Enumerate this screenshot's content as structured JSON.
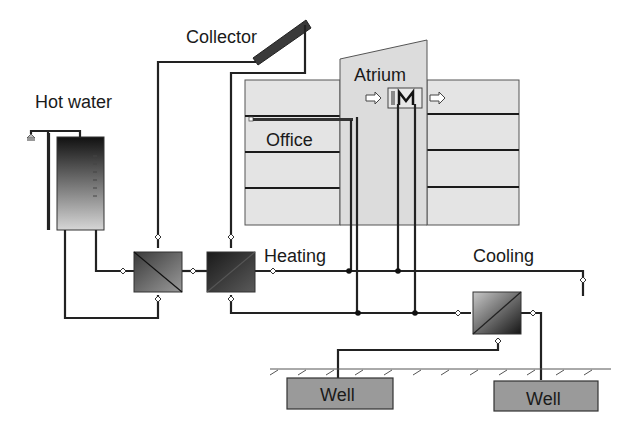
{
  "diagram": {
    "labels": {
      "collector": "Collector",
      "hot_water": "Hot water",
      "atrium": "Atrium",
      "office": "Office",
      "heating": "Heating",
      "cooling": "Cooling",
      "well_left": "Well",
      "well_right": "Well"
    },
    "components": [
      {
        "id": "collector",
        "type": "solar-collector"
      },
      {
        "id": "hot_water_tank",
        "type": "storage-tank"
      },
      {
        "id": "shower",
        "type": "tap"
      },
      {
        "id": "hx_hot_water",
        "type": "heat-exchanger"
      },
      {
        "id": "hx_heating",
        "type": "heat-exchanger"
      },
      {
        "id": "hx_cooling",
        "type": "heat-exchanger"
      },
      {
        "id": "office_building",
        "type": "building",
        "floors": 4
      },
      {
        "id": "atrium",
        "type": "building-section"
      },
      {
        "id": "right_building",
        "type": "building",
        "floors": 4
      },
      {
        "id": "atrium_air_unit",
        "type": "air-handling-coil"
      },
      {
        "id": "well_left",
        "type": "aquifer-well"
      },
      {
        "id": "well_right",
        "type": "aquifer-well"
      }
    ],
    "colors": {
      "pipe": "#222222",
      "building_fill": "#e4e4e4",
      "well_fill": "#9a9a9a",
      "tank_top": "#1a1a1a",
      "tank_bottom": "#d8d8d8"
    }
  }
}
